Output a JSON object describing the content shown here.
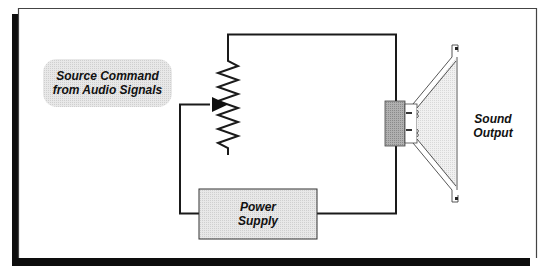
{
  "diagram": {
    "colors": {
      "line": "#1a1a1a",
      "frame_shadow": "#0d0d0d",
      "frame_border": "#555555",
      "box_fill": "#e6e6e6",
      "pill_fill": "#dedede",
      "magnet_fill": "#a9a9a9",
      "cone_fill": "#ececec"
    },
    "nodes": {
      "source_command": {
        "line1": "Source Command",
        "line2": "from Audio Signals"
      },
      "potentiometer": {
        "type": "variable-resistor"
      },
      "power_supply": {
        "line1": "Power",
        "line2": "Supply"
      },
      "speaker": {
        "type": "loudspeaker"
      },
      "sound_output": {
        "line1": "Sound",
        "line2": "Output"
      }
    },
    "edges": [
      {
        "from": "potentiometer",
        "to": "speaker",
        "label": ""
      },
      {
        "from": "power_supply",
        "to": "speaker",
        "label": ""
      },
      {
        "from": "power_supply",
        "to": "potentiometer",
        "label": "wiper"
      }
    ]
  }
}
